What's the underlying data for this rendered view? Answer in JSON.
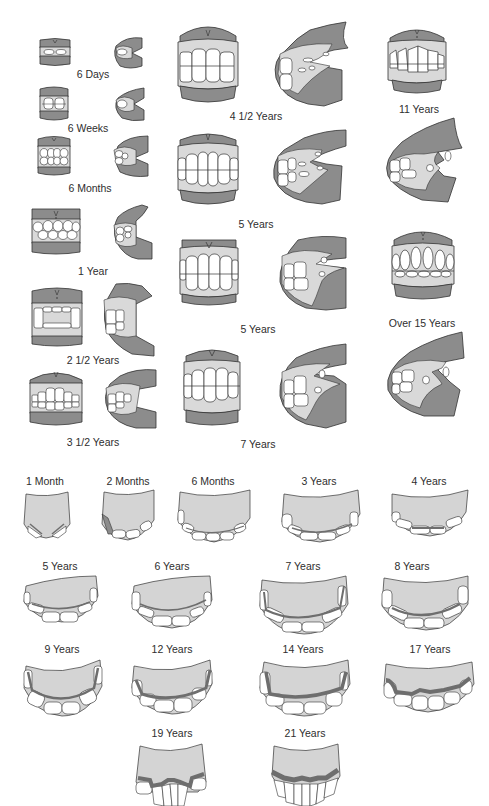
{
  "colors": {
    "gum_dark": "#8c8c8c",
    "gum_light": "#d9d9d9",
    "tooth": "#ffffff",
    "outline": "#333333",
    "palate": "#d4d4d4",
    "stain": "#6e6e6e"
  },
  "top_section": {
    "title": "Incisor and lateral views by age",
    "stages": [
      {
        "label": "6 Days",
        "x": 93,
        "y": 68
      },
      {
        "label": "6 Weeks",
        "x": 88,
        "y": 126
      },
      {
        "label": "6 Months",
        "x": 90,
        "y": 184
      },
      {
        "label": "1 Year",
        "x": 93,
        "y": 267
      },
      {
        "label": "2 1/2 Years",
        "x": 93,
        "y": 358
      },
      {
        "label": "3 1/2 Years",
        "x": 93,
        "y": 440
      },
      {
        "label": "4 1/2 Years",
        "x": 256,
        "y": 112
      },
      {
        "label": "5 Years",
        "x": 256,
        "y": 220
      },
      {
        "label": "5 Years",
        "x": 258,
        "y": 325
      },
      {
        "label": "7 Years",
        "x": 258,
        "y": 441
      },
      {
        "label": "11 Years",
        "x": 419,
        "y": 105
      },
      {
        "label": "Over 15 Years",
        "x": 422,
        "y": 319
      }
    ]
  },
  "bottom_section": {
    "title": "Upper incisor arcade by age",
    "stages": [
      {
        "label": "1 Month",
        "x": 45,
        "y": 477
      },
      {
        "label": "2 Months",
        "x": 128,
        "y": 477
      },
      {
        "label": "6 Months",
        "x": 213,
        "y": 477
      },
      {
        "label": "3 Years",
        "x": 319,
        "y": 477
      },
      {
        "label": "4 Years",
        "x": 429,
        "y": 477
      },
      {
        "label": "5 Years",
        "x": 60,
        "y": 562
      },
      {
        "label": "6 Years",
        "x": 172,
        "y": 562
      },
      {
        "label": "7 Years",
        "x": 303,
        "y": 562
      },
      {
        "label": "8 Years",
        "x": 412,
        "y": 562
      },
      {
        "label": "9 Years",
        "x": 62,
        "y": 645
      },
      {
        "label": "12 Years",
        "x": 172,
        "y": 645
      },
      {
        "label": "14 Years",
        "x": 303,
        "y": 645
      },
      {
        "label": "17 Years",
        "x": 430,
        "y": 645
      },
      {
        "label": "19 Years",
        "x": 172,
        "y": 729
      },
      {
        "label": "21 Years",
        "x": 305,
        "y": 729
      }
    ]
  }
}
